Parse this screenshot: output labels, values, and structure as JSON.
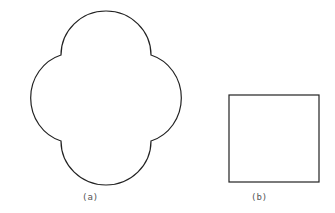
{
  "figures": [
    {
      "id": "a",
      "label": "(a)",
      "shape": "quatrefoil",
      "description": "Square with semicircular lobes on each side"
    },
    {
      "id": "b",
      "label": "(b)",
      "shape": "square"
    }
  ],
  "colors": {
    "stroke": "#222222",
    "label": "#555555",
    "background": "#ffffff"
  }
}
